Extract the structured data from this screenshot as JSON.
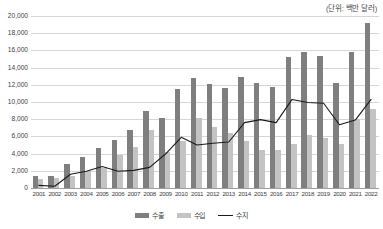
{
  "unit_note": "(단위: 백만 달러)",
  "legend": {
    "position": "bottom",
    "items": [
      {
        "key": "export",
        "label": "수출",
        "marker": "bar",
        "color": "#7f7f7f"
      },
      {
        "key": "import",
        "label": "수입",
        "marker": "bar",
        "color": "#c3c3c3"
      },
      {
        "key": "balance",
        "label": "수지",
        "marker": "line",
        "color": "#1a1a1a"
      }
    ]
  },
  "chart_data": {
    "type": "bar",
    "title": "",
    "subtitle": "",
    "xlabel": "",
    "ylabel": "",
    "unit": "백만 달러",
    "grid": true,
    "ylim": [
      0,
      20000
    ],
    "ytick_interval": 2000,
    "ytick_labels": [
      "0",
      "2,000",
      "4,000",
      "6,000",
      "8,000",
      "10,000",
      "12,000",
      "14,000",
      "16,000",
      "18,000",
      "20,000"
    ],
    "ytick_values": [
      0,
      2000,
      4000,
      6000,
      8000,
      10000,
      12000,
      14000,
      16000,
      18000,
      20000
    ],
    "categories": [
      "2001",
      "2002",
      "2003",
      "2004",
      "2005",
      "2006",
      "2007",
      "2008",
      "2009",
      "2010",
      "2011",
      "2012",
      "2013",
      "2014",
      "2015",
      "2016",
      "2017",
      "2018",
      "2019",
      "2020",
      "2021",
      "2022"
    ],
    "series": [
      {
        "name": "수출",
        "type": "bar",
        "color": "#7f7f7f",
        "values": [
          1350,
          1400,
          2800,
          3650,
          4650,
          5600,
          6700,
          9000,
          8100,
          11500,
          12750,
          12100,
          11600,
          12950,
          12250,
          11800,
          15250,
          15800,
          15400,
          12250,
          15850,
          19150
        ]
      },
      {
        "name": "수입",
        "type": "bar",
        "color": "#c3c3c3",
        "values": [
          1100,
          1200,
          1350,
          1950,
          2300,
          3800,
          4750,
          6700,
          4200,
          5500,
          8150,
          7050,
          6350,
          5450,
          4450,
          4400,
          5150,
          6200,
          5850,
          5150,
          8000,
          9200
        ]
      },
      {
        "name": "수지",
        "type": "line",
        "color": "#1a1a1a",
        "values": [
          300,
          200,
          1600,
          1950,
          2500,
          1950,
          2050,
          2400,
          3950,
          5900,
          5000,
          5200,
          5350,
          7600,
          7950,
          7600,
          10300,
          9950,
          9850,
          7350,
          7900,
          10300
        ]
      }
    ]
  }
}
